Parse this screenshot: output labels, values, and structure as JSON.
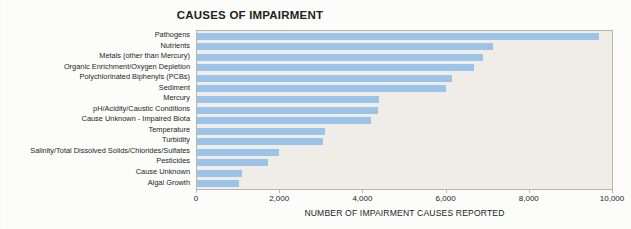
{
  "chart_data": {
    "type": "bar",
    "orientation": "horizontal",
    "title": "CAUSES OF IMPAIRMENT",
    "xlabel": "NUMBER OF IMPAIRMENT CAUSES REPORTED",
    "ylabel": "",
    "xlim": [
      0,
      10000
    ],
    "xticks": [
      0,
      2000,
      4000,
      6000,
      8000,
      10000
    ],
    "xtick_labels": [
      "0",
      "2,000",
      "4,000",
      "6,000",
      "8,000",
      "10,000"
    ],
    "grid": false,
    "legend": null,
    "bar_color": "#9cc3e8",
    "plot_background": "#f0ede8",
    "categories": [
      "Pathogens",
      "Nutrients",
      "Metals (other than Mercury)",
      "Organic Enrichment/Oxygen Depletion",
      "Polychlorinated Biphenyls (PCBs)",
      "Sediment",
      "Mercury",
      "pH/Acidity/Caustic Conditions",
      "Cause Unknown - Impaired Biota",
      "Temperature",
      "Turbidity",
      "Salinity/Total Dissolved Solids/Chlorides/Sulfates",
      "Pesticides",
      "Cause Unknown",
      "Algal Growth"
    ],
    "values": [
      9670,
      7120,
      6870,
      6650,
      6140,
      5990,
      4380,
      4350,
      4180,
      3080,
      3030,
      1960,
      1710,
      1080,
      1000
    ]
  }
}
